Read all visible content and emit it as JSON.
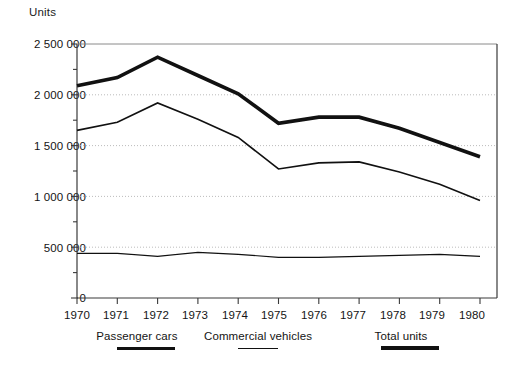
{
  "chart_data": {
    "type": "line",
    "title": "",
    "ylabel": "Units",
    "xlabel": "",
    "ylim": [
      0,
      2500000
    ],
    "xlim": [
      1970,
      1980
    ],
    "grid": "horizontal dotted gridlines at 500 000 intervals",
    "legend_position": "below x-axis",
    "y_tick_labels": [
      "2 500 000",
      "2 000 000",
      "1 500 000",
      "1 000 000",
      "500 000",
      "0"
    ],
    "y_tick_values": [
      2500000,
      2000000,
      1500000,
      1000000,
      500000,
      0
    ],
    "y_minor_ticks": [
      2250000,
      1750000,
      1250000,
      750000,
      250000
    ],
    "categories": [
      "1970",
      "1971",
      "1972",
      "1973",
      "1974",
      "1975",
      "1976",
      "1977",
      "1978",
      "1979",
      "1980"
    ],
    "x": [
      1970,
      1971,
      1972,
      1973,
      1974,
      1975,
      1976,
      1977,
      1978,
      1979,
      1980
    ],
    "series": [
      {
        "name": "Total units",
        "values": [
          2090000,
          2170000,
          2370000,
          2190000,
          2010000,
          1720000,
          1780000,
          1780000,
          1670000,
          1530000,
          1390000
        ]
      },
      {
        "name": "Passenger cars",
        "values": [
          1650000,
          1730000,
          1920000,
          1760000,
          1580000,
          1270000,
          1330000,
          1340000,
          1240000,
          1120000,
          960000
        ]
      },
      {
        "name": "Commercial vehicles",
        "values": [
          440000,
          440000,
          410000,
          450000,
          430000,
          400000,
          400000,
          410000,
          420000,
          430000,
          410000
        ]
      }
    ]
  },
  "axis": {
    "y_title": "Units",
    "y_labels": [
      "2 500 000",
      "2 000 000",
      "1 500 000",
      "1 000 000",
      "500 000",
      "0"
    ],
    "x_labels": [
      "1970",
      "1971",
      "1972",
      "1973",
      "1974",
      "1975",
      "1976",
      "1977",
      "1978",
      "1979",
      "1980"
    ]
  },
  "legend": {
    "items": [
      {
        "label": "Passenger cars",
        "weight": "medium",
        "color": "#111111"
      },
      {
        "label": "Commercial vehicles",
        "weight": "thin",
        "color": "#111111"
      },
      {
        "label": "Total units",
        "weight": "thick",
        "color": "#111111"
      }
    ]
  },
  "colors": {
    "line": "#111111",
    "grid": "#b4b4b4",
    "frame": "#3a3a3a",
    "background": "#ffffff"
  }
}
